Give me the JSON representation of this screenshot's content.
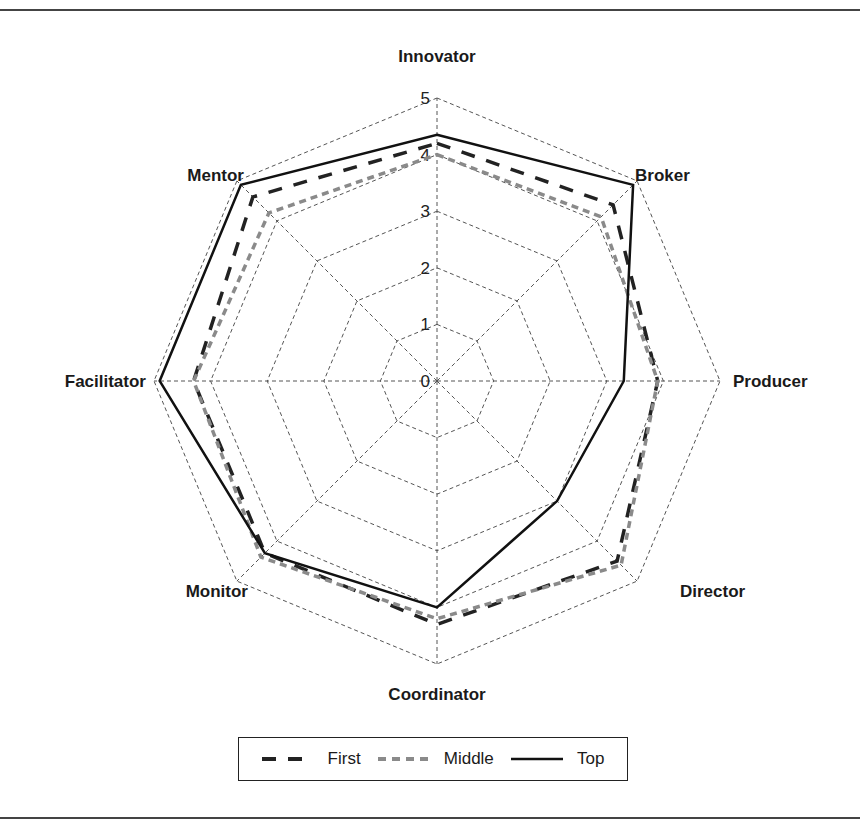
{
  "chart_data": {
    "type": "radar",
    "title": "",
    "categories": [
      "Innovator",
      "Broker",
      "Producer",
      "Director",
      "Coordinator",
      "Monitor",
      "Facilitator",
      "Mentor"
    ],
    "rlim": [
      0,
      5
    ],
    "r_ticks": [
      "0",
      "1",
      "2",
      "3",
      "4",
      "5"
    ],
    "grid": true,
    "legend_position": "bottom",
    "series": [
      {
        "name": "First",
        "style": "dashed-black",
        "color": "#222222",
        "values": [
          4.2,
          4.4,
          3.9,
          4.5,
          4.3,
          4.3,
          4.3,
          4.6
        ]
      },
      {
        "name": "Middle",
        "style": "dashed-gray",
        "color": "#8a8a8a",
        "values": [
          4.0,
          4.1,
          3.9,
          4.6,
          4.2,
          4.4,
          4.3,
          4.2
        ]
      },
      {
        "name": "Top",
        "style": "solid-black",
        "color": "#111111",
        "values": [
          4.35,
          4.9,
          3.3,
          3.0,
          4.0,
          4.3,
          4.9,
          4.9
        ]
      }
    ]
  },
  "legend": {
    "items": [
      {
        "label": "First"
      },
      {
        "label": "Middle"
      },
      {
        "label": "Top"
      }
    ]
  }
}
